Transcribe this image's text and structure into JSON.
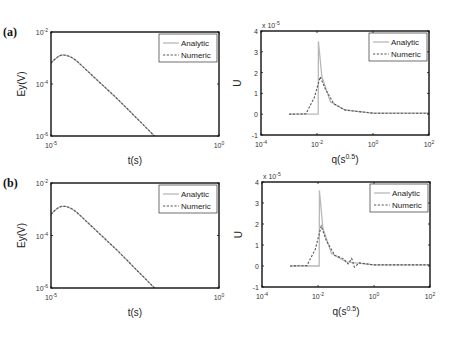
{
  "panels": [
    {
      "label": "(a)"
    },
    {
      "label": "(b)"
    }
  ],
  "legend": {
    "analytic": "Analytic",
    "numeric": "Numeric"
  },
  "colors": {
    "analytic": "#b8b8b8",
    "numeric": "#555555",
    "axis": "#111111"
  },
  "chart_data": [
    {
      "id": "a-left",
      "panel": "(a)",
      "type": "line",
      "xscale": "log",
      "yscale": "log",
      "xlabel": "t(s)",
      "ylabel": "Ey(V)",
      "xlim": [
        1e-05,
        1.0
      ],
      "ylim": [
        1e-06,
        0.01
      ],
      "xticks": [
        "10^-5",
        "10^0"
      ],
      "yticks": [
        "10^-6",
        "10^-4",
        "10^-2"
      ],
      "legend_position": "upper right",
      "series": [
        {
          "name": "Analytic",
          "style": "solid",
          "x": [
            1e-05,
            2.3e-05,
            0.0001,
            0.001,
            0.012
          ],
          "y": [
            0.00064,
            0.0013,
            0.0004,
            2.5e-05,
            1e-06
          ]
        },
        {
          "name": "Numeric",
          "style": "dashed",
          "x": [
            1e-05,
            2.3e-05,
            0.0001,
            0.001,
            0.012
          ],
          "y": [
            0.00064,
            0.0013,
            0.0004,
            2.5e-05,
            1e-06
          ]
        }
      ]
    },
    {
      "id": "a-right",
      "panel": "(a)",
      "type": "line",
      "xscale": "log",
      "yscale": "linear",
      "xlabel": "q(s^0.5)",
      "ylabel": "U",
      "y_multiplier": "x 10^-5",
      "xlim": [
        0.0001,
        100.0
      ],
      "ylim": [
        -1,
        4
      ],
      "xticks": [
        "10^-4",
        "10^-2",
        "10^0",
        "10^2"
      ],
      "yticks": [
        "-1",
        "0",
        "1",
        "2",
        "3",
        "4"
      ],
      "legend_position": "upper right",
      "series": [
        {
          "name": "Analytic",
          "style": "solid",
          "x": [
            0.001,
            0.011,
            0.0112,
            0.015,
            0.03,
            0.1,
            1.0,
            100.0
          ],
          "y": [
            0,
            0,
            3.5,
            1.8,
            0.6,
            0.2,
            0.05,
            0.05
          ]
        },
        {
          "name": "Numeric",
          "style": "dashed",
          "x": [
            0.001,
            0.004,
            0.008,
            0.013,
            0.02,
            0.04,
            0.1,
            1.0,
            100.0
          ],
          "y": [
            0,
            0.02,
            0.8,
            1.8,
            1.2,
            0.5,
            0.2,
            0.05,
            0.05
          ]
        }
      ]
    },
    {
      "id": "b-left",
      "panel": "(b)",
      "type": "line",
      "xscale": "log",
      "yscale": "log",
      "xlabel": "t(s)",
      "ylabel": "Ey(V)",
      "xlim": [
        1e-05,
        1.0
      ],
      "ylim": [
        1e-06,
        0.01
      ],
      "xticks": [
        "10^-5",
        "10^0"
      ],
      "yticks": [
        "10^-6",
        "10^-4",
        "10^-2"
      ],
      "legend_position": "upper right",
      "series": [
        {
          "name": "Analytic",
          "style": "solid",
          "x": [
            1e-05,
            2.3e-05,
            0.0001,
            0.001,
            0.012
          ],
          "y": [
            0.00064,
            0.0013,
            0.0004,
            2.5e-05,
            1e-06
          ]
        },
        {
          "name": "Numeric",
          "style": "dashed",
          "x": [
            1e-05,
            2.3e-05,
            0.0001,
            0.001,
            0.012
          ],
          "y": [
            0.00064,
            0.0013,
            0.0004,
            2.5e-05,
            1e-06
          ]
        }
      ]
    },
    {
      "id": "b-right",
      "panel": "(b)",
      "type": "line",
      "xscale": "log",
      "yscale": "linear",
      "xlabel": "q(s^0.5)",
      "ylabel": "U",
      "y_multiplier": "x 10^-5",
      "xlim": [
        0.0001,
        100.0
      ],
      "ylim": [
        -1,
        4
      ],
      "xticks": [
        "10^-4",
        "10^-2",
        "10^0",
        "10^2"
      ],
      "yticks": [
        "-1",
        "0",
        "1",
        "2",
        "3",
        "4"
      ],
      "legend_position": "upper right",
      "series": [
        {
          "name": "Analytic",
          "style": "solid",
          "x": [
            0.001,
            0.011,
            0.0112,
            0.015,
            0.03,
            0.1,
            1.0,
            100.0
          ],
          "y": [
            0,
            0,
            3.6,
            1.8,
            0.6,
            0.2,
            0.05,
            0.05
          ]
        },
        {
          "name": "Numeric",
          "style": "dashed",
          "x": [
            0.001,
            0.004,
            0.008,
            0.013,
            0.02,
            0.04,
            0.08,
            0.12,
            0.16,
            0.2,
            0.3,
            1.0,
            100.0
          ],
          "y": [
            0,
            0.02,
            0.8,
            1.9,
            1.2,
            0.5,
            0.35,
            0.1,
            0.35,
            -0.05,
            0.15,
            0.05,
            0.05
          ]
        }
      ]
    }
  ]
}
